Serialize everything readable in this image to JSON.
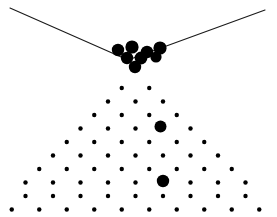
{
  "figure": {
    "title": "",
    "background_color": "#ffffff",
    "ink_color": "#000000",
    "width": 277,
    "height": 217
  },
  "chart_data": {
    "type": "scatter",
    "title": "",
    "subtitle": "",
    "xlabel": "",
    "ylabel": "",
    "xlim": [
      0,
      277
    ],
    "ylim": [
      217,
      0
    ],
    "grid": false,
    "legend": "none",
    "annotations": [],
    "series": [
      {
        "name": "funnel-walls",
        "type": "line",
        "color": "#1a1a1a",
        "stroke_width": 1.1,
        "segments": [
          {
            "name": "left-wall",
            "x": [
              10,
              128
            ],
            "y": [
              8,
              60
            ]
          },
          {
            "name": "right-wall",
            "x": [
              128,
              265
            ],
            "y": [
              60,
              10
            ]
          }
        ]
      },
      {
        "name": "balls-in-funnel",
        "type": "scatter",
        "color": "#000000",
        "marker": "circle",
        "radius": 6.2,
        "count": 8,
        "x": [
          118,
          132,
          147,
          160,
          127,
          141,
          156,
          135
        ],
        "y": [
          50,
          47,
          52,
          48,
          58,
          58,
          57,
          67
        ],
        "radii": [
          6.2,
          6.6,
          6.2,
          6.6,
          6.2,
          6.4,
          5.6,
          6.2
        ]
      },
      {
        "name": "lattice-pegs",
        "type": "scatter",
        "color": "#000000",
        "marker": "circle",
        "radius": 2.2,
        "rows": 10,
        "row_spacing": 13.5,
        "column_spacing": 27.5,
        "apex_x": 135.5,
        "apex_y": 88,
        "row_counts": [
          2,
          3,
          4,
          5,
          6,
          7,
          8,
          9,
          9,
          10
        ],
        "enlarged_pegs": [
          {
            "x": 160.5,
            "y": 126.5,
            "radius": 6.0
          },
          {
            "x": 88.0,
            "y": 158.0,
            "radius": 6.4
          },
          {
            "x": 163.0,
            "y": 181.0,
            "radius": 6.2
          }
        ]
      }
    ]
  }
}
